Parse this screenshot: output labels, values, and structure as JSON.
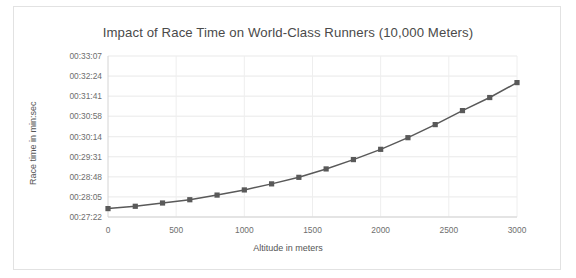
{
  "chart_data": {
    "type": "line",
    "title": "Impact of Race Time on World-Class Runners (10,000 Meters)",
    "xlabel": "Altitude in meters",
    "ylabel": "Race time in min:sec",
    "grid": true,
    "legend": "none",
    "marker": "square",
    "line_color": "#595959",
    "marker_color": "#595959",
    "x": [
      0,
      200,
      400,
      600,
      800,
      1000,
      1200,
      1400,
      1600,
      1800,
      2000,
      2200,
      2400,
      2600,
      2800,
      3000
    ],
    "values": [
      "00:27:40",
      "00:27:45",
      "00:27:52",
      "00:27:59",
      "00:28:09",
      "00:28:20",
      "00:28:33",
      "00:28:47",
      "00:29:05",
      "00:29:25",
      "00:29:47",
      "00:30:12",
      "00:30:40",
      "00:31:10",
      "00:31:38",
      "00:32:10"
    ],
    "values_seconds": [
      1660,
      1665,
      1672,
      1679,
      1689,
      1700,
      1713,
      1727,
      1745,
      1765,
      1787,
      1812,
      1840,
      1870,
      1898,
      1930
    ],
    "xlim": [
      0,
      3000
    ],
    "xticks": [
      "0",
      "500",
      "1000",
      "1500",
      "2000",
      "2500",
      "3000"
    ],
    "xtick_values": [
      0,
      500,
      1000,
      1500,
      2000,
      2500,
      3000
    ],
    "ylim_seconds": [
      1642,
      1987
    ],
    "yticks": [
      "00:27:22",
      "00:28:05",
      "00:28:48",
      "00:29:31",
      "00:30:14",
      "00:30:58",
      "00:31:41",
      "00:32:24",
      "00:33:07"
    ],
    "ytick_values": [
      1642,
      1685,
      1728,
      1771,
      1814,
      1858,
      1901,
      1944,
      1987
    ]
  }
}
